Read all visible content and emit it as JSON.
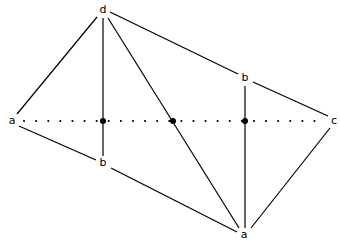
{
  "diagram": {
    "type": "graph",
    "stroke_color": "#000000",
    "background": "#ffffff",
    "nodes": [
      {
        "id": "d_top",
        "label": "d",
        "x": 103,
        "y": 10
      },
      {
        "id": "b_upper",
        "label": "b",
        "x": 245,
        "y": 78
      },
      {
        "id": "a_left",
        "label": "a",
        "x": 12,
        "y": 121
      },
      {
        "id": "c_right",
        "label": "c",
        "x": 334,
        "y": 121
      },
      {
        "id": "b_lower",
        "label": "b",
        "x": 103,
        "y": 163
      },
      {
        "id": "a_bottom",
        "label": "a",
        "x": 244,
        "y": 235
      }
    ],
    "junctions": [
      {
        "id": "j1",
        "x": 103,
        "y": 121
      },
      {
        "id": "j2",
        "x": 173,
        "y": 121
      },
      {
        "id": "j3",
        "x": 245,
        "y": 121
      }
    ],
    "edges": [
      {
        "from": "d_top",
        "to": "a_left",
        "style": "solid"
      },
      {
        "from": "d_top",
        "to": "b_lower",
        "style": "solid",
        "via": "j1"
      },
      {
        "from": "d_top",
        "to": "a_bottom",
        "style": "solid",
        "via": "j2"
      },
      {
        "from": "d_top",
        "to": "b_upper",
        "style": "solid"
      },
      {
        "from": "b_upper",
        "to": "c_right",
        "style": "solid"
      },
      {
        "from": "b_upper",
        "to": "a_bottom",
        "style": "solid",
        "via": "j3"
      },
      {
        "from": "a_left",
        "to": "b_lower",
        "style": "solid"
      },
      {
        "from": "b_lower",
        "to": "a_bottom",
        "style": "solid"
      },
      {
        "from": "c_right",
        "to": "a_bottom",
        "style": "solid"
      },
      {
        "from": "a_left",
        "to": "c_right",
        "style": "dotted"
      }
    ]
  }
}
